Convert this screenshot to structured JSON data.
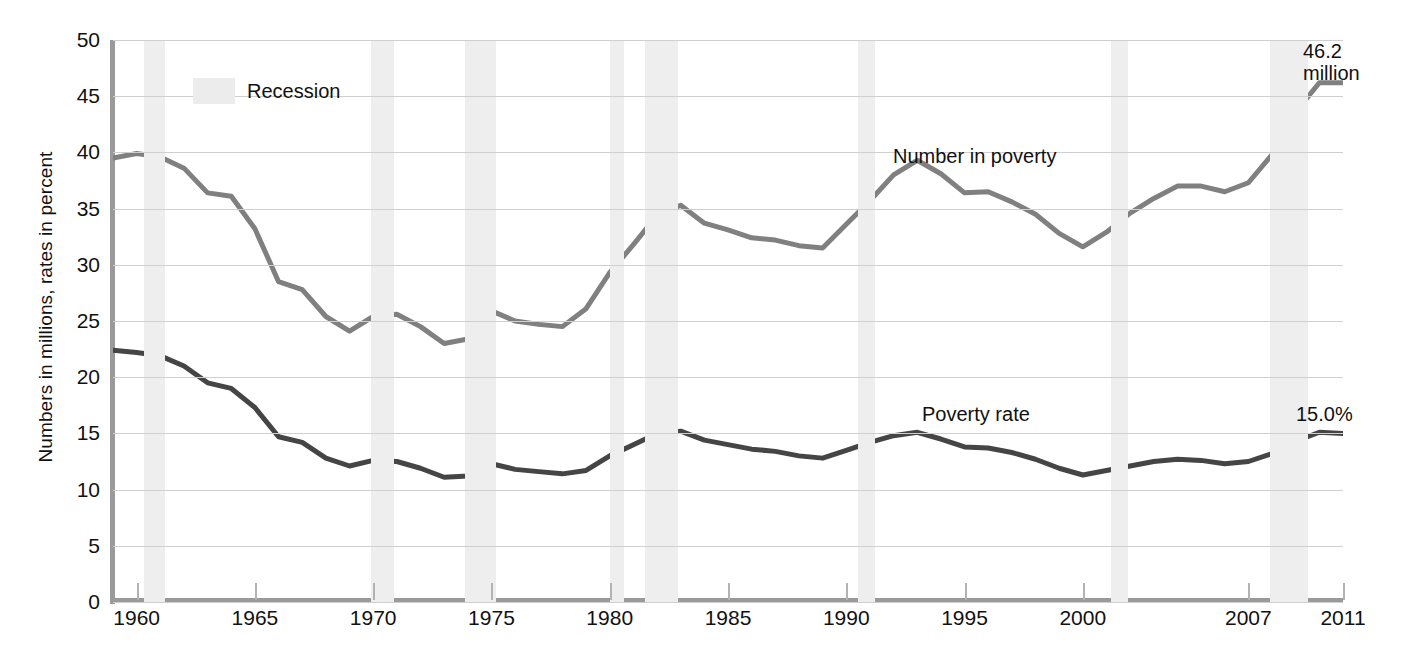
{
  "chart_data": {
    "type": "line",
    "title": "",
    "xlabel": "",
    "ylabel": "Numbers in millions, rates in percent",
    "xlim": [
      1959,
      2011
    ],
    "ylim": [
      0,
      50
    ],
    "grid": true,
    "legend_position": "top-left",
    "y_ticks": [
      0,
      5,
      10,
      15,
      20,
      25,
      30,
      35,
      40,
      45,
      50
    ],
    "x_ticks": [
      1960,
      1965,
      1970,
      1975,
      1980,
      1985,
      1990,
      1995,
      2000,
      2007,
      2011
    ],
    "x_tick_labels": [
      "1960",
      "1965",
      "1970",
      "1975",
      "1980",
      "1985",
      "1990",
      "1995",
      "2000",
      "2007",
      "2011"
    ],
    "x": [
      1959,
      1960,
      1961,
      1962,
      1963,
      1964,
      1965,
      1966,
      1967,
      1968,
      1969,
      1970,
      1971,
      1972,
      1973,
      1974,
      1975,
      1976,
      1977,
      1978,
      1979,
      1980,
      1981,
      1982,
      1983,
      1984,
      1985,
      1986,
      1987,
      1988,
      1989,
      1990,
      1991,
      1992,
      1993,
      1994,
      1995,
      1996,
      1997,
      1998,
      1999,
      2000,
      2001,
      2002,
      2003,
      2004,
      2005,
      2006,
      2007,
      2008,
      2009,
      2010,
      2011
    ],
    "series": [
      {
        "name": "Number in poverty",
        "label": "Number in poverty",
        "units": "millions",
        "color": "#808080",
        "values": [
          39.5,
          39.9,
          39.6,
          38.6,
          36.4,
          36.1,
          33.2,
          28.5,
          27.8,
          25.4,
          24.1,
          25.4,
          25.6,
          24.5,
          23.0,
          23.4,
          25.9,
          25.0,
          24.7,
          24.5,
          26.1,
          29.3,
          31.8,
          34.4,
          35.3,
          33.7,
          33.1,
          32.4,
          32.2,
          31.7,
          31.5,
          33.6,
          35.7,
          38.0,
          39.3,
          38.1,
          36.4,
          36.5,
          35.6,
          34.5,
          32.8,
          31.6,
          32.9,
          34.6,
          35.9,
          37.0,
          37.0,
          36.5,
          37.3,
          39.8,
          43.6,
          46.2,
          46.2
        ],
        "endpoint_label": "46.2 million"
      },
      {
        "name": "Poverty rate",
        "label": "Poverty rate",
        "units": "percent",
        "color": "#454545",
        "values": [
          22.4,
          22.2,
          21.9,
          21.0,
          19.5,
          19.0,
          17.3,
          14.7,
          14.2,
          12.8,
          12.1,
          12.6,
          12.5,
          11.9,
          11.1,
          11.2,
          12.3,
          11.8,
          11.6,
          11.4,
          11.7,
          13.0,
          14.0,
          15.0,
          15.2,
          14.4,
          14.0,
          13.6,
          13.4,
          13.0,
          12.8,
          13.5,
          14.2,
          14.8,
          15.1,
          14.5,
          13.8,
          13.7,
          13.3,
          12.7,
          11.9,
          11.3,
          11.7,
          12.1,
          12.5,
          12.7,
          12.6,
          12.3,
          12.5,
          13.2,
          14.3,
          15.1,
          15.0
        ],
        "endpoint_label": "15.0%"
      }
    ],
    "legend": [
      {
        "label": "Recession",
        "swatch_color": "#ececec",
        "type": "band"
      }
    ],
    "recession_bands": [
      {
        "start": 1960.3,
        "end": 1961.2
      },
      {
        "start": 1969.9,
        "end": 1970.9
      },
      {
        "start": 1973.9,
        "end": 1975.2
      },
      {
        "start": 1980.0,
        "end": 1980.6
      },
      {
        "start": 1981.5,
        "end": 1982.9
      },
      {
        "start": 1990.5,
        "end": 1991.2
      },
      {
        "start": 2001.2,
        "end": 2001.9
      },
      {
        "start": 2007.9,
        "end": 2009.5
      }
    ],
    "annotations": [
      {
        "name": "number-in-poverty",
        "text": "Number in poverty"
      },
      {
        "name": "poverty-rate",
        "text": "Poverty rate"
      },
      {
        "name": "end-number",
        "text": "46.2\nmillion"
      },
      {
        "name": "end-rate",
        "text": "15.0%"
      }
    ]
  },
  "axis": {
    "y_title": "Numbers in millions, rates in percent"
  },
  "legend": {
    "recession_label": "Recession"
  },
  "labels": {
    "number_in_poverty": "Number in poverty",
    "poverty_rate": "Poverty rate",
    "end_number_line1": "46.2",
    "end_number_line2": "million",
    "end_rate": "15.0%"
  }
}
